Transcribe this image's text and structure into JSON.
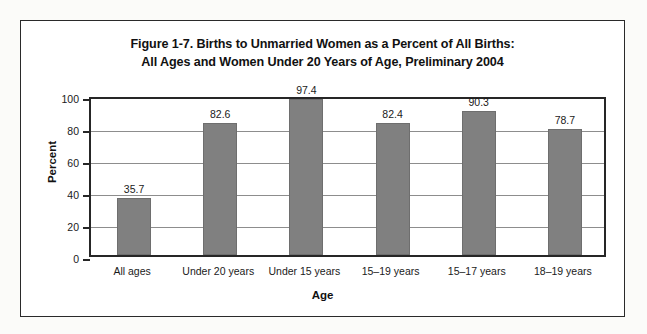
{
  "chart_data": {
    "type": "bar",
    "title": "Figure 1-7.  Births to Unmarried Women as a Percent of All Births: All Ages and Women Under 20 Years of Age, Preliminary 2004",
    "title_lines": [
      "Figure 1-7.  Births to Unmarried Women as a Percent of All Births:",
      "All Ages and Women Under 20 Years of Age, Preliminary 2004"
    ],
    "xlabel": "Age",
    "ylabel": "Percent",
    "categories": [
      "All ages",
      "Under 20 years",
      "Under 15 years",
      "15–19 years",
      "15–17 years",
      "18–19 years"
    ],
    "values": [
      35.7,
      82.6,
      97.4,
      82.4,
      90.3,
      78.7
    ],
    "value_labels": [
      "35.7",
      "82.6",
      "97.4",
      "82.4",
      "90.3",
      "78.7"
    ],
    "ylim": [
      0,
      100
    ],
    "ytick_labels": [
      "0",
      "20",
      "40",
      "60",
      "80",
      "100"
    ],
    "ytick_values": [
      0,
      20,
      40,
      60,
      80,
      100
    ],
    "grid": "horizontal",
    "legend": "none",
    "bar_color": "#808080",
    "axis_color": "#262626",
    "gridline_color": "#8d8d8d",
    "plot_background": "#ffffff",
    "frame_color": "#2a2a2a",
    "page_background": "#fbfbf9"
  }
}
